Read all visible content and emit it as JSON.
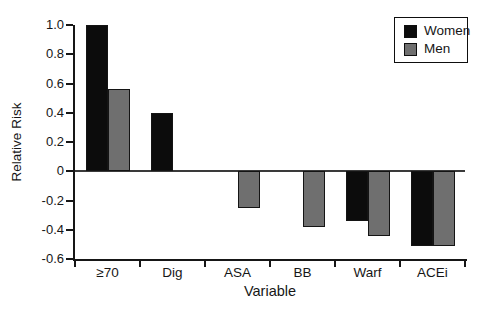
{
  "chart_data": {
    "type": "bar",
    "title": "",
    "xlabel": "Variable",
    "ylabel": "Relative Risk",
    "categories": [
      "≥70",
      "Dig",
      "ASA",
      "BB",
      "Warf",
      "ACEi"
    ],
    "series": [
      {
        "name": "Women",
        "color": "#0c0c0c",
        "values": [
          1.0,
          0.4,
          null,
          null,
          -0.34,
          -0.51
        ]
      },
      {
        "name": "Men",
        "color": "#6f6f6f",
        "values": [
          0.56,
          null,
          -0.25,
          -0.38,
          -0.44,
          -0.51
        ]
      }
    ],
    "ylim": [
      -0.6,
      1.0
    ],
    "ytick_labels": [
      "1.0",
      "0.8",
      "0.6",
      "0.4",
      "0.2",
      "0",
      "-0.2",
      "-0.4",
      "-0.6"
    ],
    "grid": false,
    "legend_position": "top-right",
    "legend": [
      "Women",
      "Men"
    ]
  },
  "colors": {
    "women_bar": "#0c0c0c",
    "men_bar": "#6f6f6f",
    "bar_border": "#141414",
    "axis": "#161616",
    "background": "#ffffff"
  }
}
